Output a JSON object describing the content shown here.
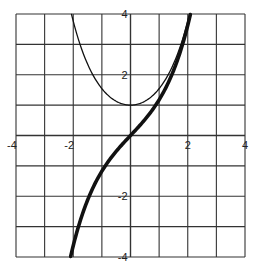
{
  "chart_data": {
    "type": "line",
    "title": "",
    "xlabel": "",
    "ylabel": "",
    "xlim": [
      -4,
      4
    ],
    "ylim": [
      -4,
      4
    ],
    "grid": true,
    "grid_step": 1,
    "legend": null,
    "x_tick_labels": [
      {
        "value": -4,
        "text": "-4"
      },
      {
        "value": -2,
        "text": "-2"
      },
      {
        "value": 2,
        "text": "2"
      },
      {
        "value": 4,
        "text": "4"
      }
    ],
    "y_tick_labels": [
      {
        "value": 4,
        "text": "4"
      },
      {
        "value": 2,
        "text": "2"
      },
      {
        "value": -2,
        "text": "-2"
      },
      {
        "value": -4,
        "text": "-4"
      }
    ],
    "series": [
      {
        "name": "thin curve (cosh x)",
        "style": "thin",
        "x": [
          -2.06,
          -2.0,
          -1.5,
          -1.0,
          -0.5,
          0.0,
          0.5,
          1.0,
          1.5,
          2.0,
          2.06
        ],
        "values": [
          4.0,
          3.76,
          2.35,
          1.54,
          1.13,
          1.0,
          1.13,
          1.54,
          2.35,
          3.76,
          4.0
        ]
      },
      {
        "name": "thick curve (sinh x)",
        "style": "thick",
        "x": [
          -2.09,
          -2.0,
          -1.5,
          -1.0,
          -0.5,
          0.0,
          0.5,
          1.0,
          1.5,
          2.0,
          2.09
        ],
        "values": [
          -4.0,
          -3.63,
          -2.13,
          -1.18,
          -0.52,
          0.0,
          0.52,
          1.18,
          2.13,
          3.63,
          4.0
        ]
      }
    ],
    "colors": {
      "grid": "#333333",
      "curve": "#111111"
    }
  }
}
